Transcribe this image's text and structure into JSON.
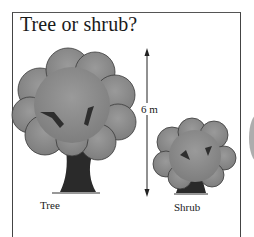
{
  "title": "Tree or shrub?",
  "figures": [
    {
      "id": "tree",
      "label": "Tree"
    },
    {
      "id": "shrub",
      "label": "Shrub"
    }
  ],
  "height_marker": {
    "label": "6 m",
    "direction": "vertical double arrow"
  },
  "colors": {
    "frame": "#444444",
    "foliage": "#8c8c8c",
    "foliage_edge": "#3a3a3a",
    "trunk": "#2a2a2a",
    "text": "#1a1a1a"
  }
}
